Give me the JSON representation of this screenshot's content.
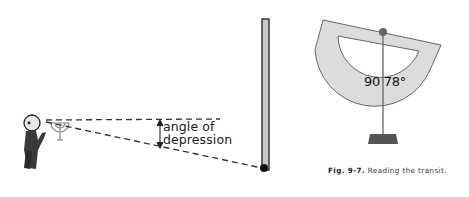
{
  "figure": {
    "left_panel": {
      "angle_label_line1": "angle of",
      "angle_label_line2": "depression",
      "elements": [
        "observer",
        "transit-instrument",
        "horizontal-sight-line",
        "line-of-sight-to-base",
        "vertical-pole",
        "target-point"
      ]
    },
    "right_panel": {
      "protractor_reading_left": "90",
      "protractor_reading_right": "78°",
      "caption_label": "Fig. 9-7.",
      "caption_text": "Reading the transit."
    },
    "colors": {
      "line": "#333333",
      "protractor_fill": "#d9d9d9",
      "pole_fill": "#c8c8c8",
      "base_fill": "#555555"
    }
  }
}
